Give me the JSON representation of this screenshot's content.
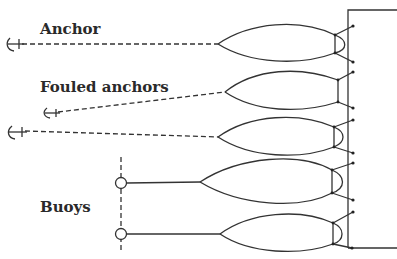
{
  "labels": {
    "anchor": "Anchor",
    "fouled_anchors": "Fouled anchors",
    "buoys": "Buoys"
  },
  "colors": {
    "line": "#333333",
    "background": "#ffffff"
  },
  "diagram": {
    "structure": "vessel/pier block at right",
    "moorings": [
      {
        "type": "anchor",
        "count": 1
      },
      {
        "type": "fouled anchors",
        "count": 2
      },
      {
        "type": "buoys",
        "count": 2
      }
    ]
  }
}
